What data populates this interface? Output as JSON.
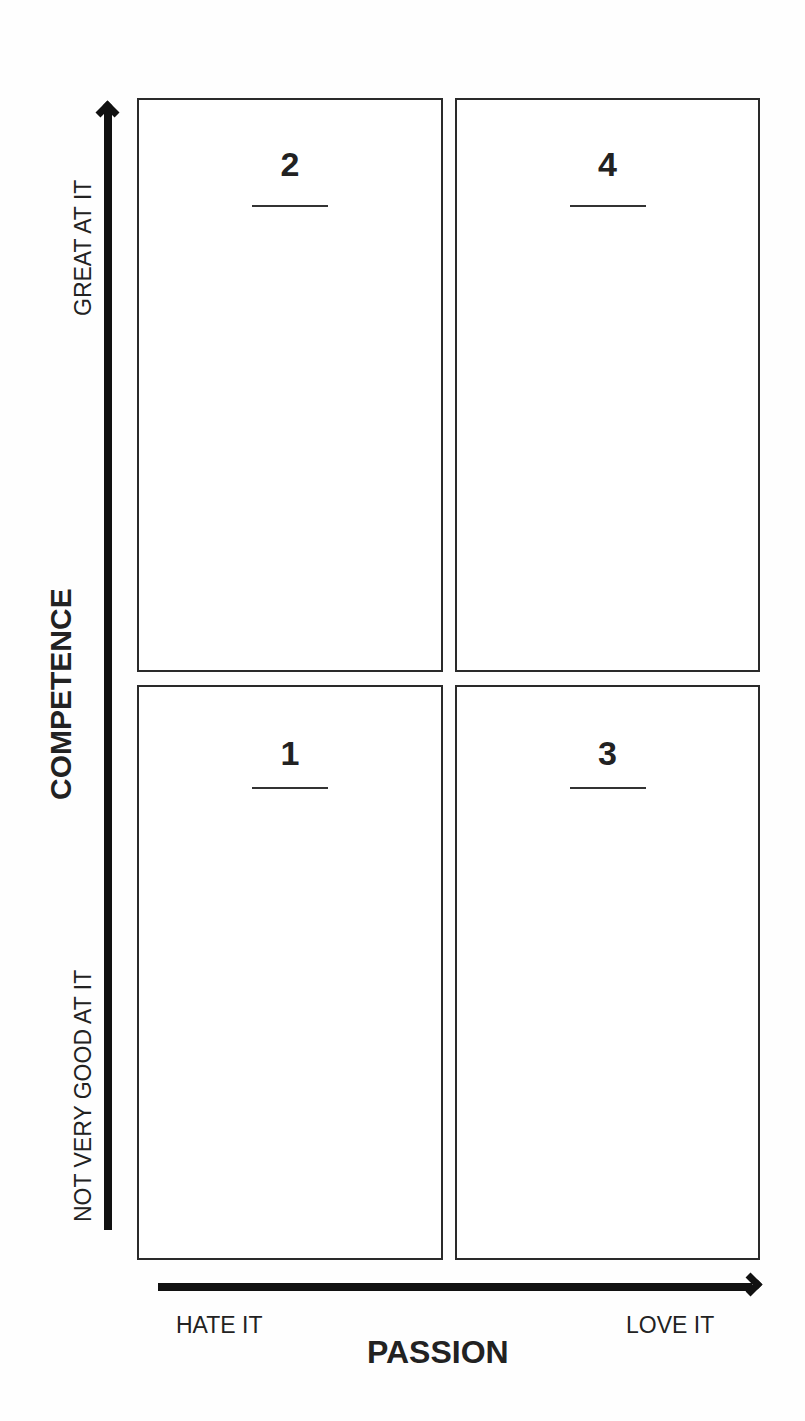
{
  "diagram": {
    "type": "2x2 matrix",
    "y_axis": {
      "title": "COMPETENCE",
      "high_label": "GREAT AT IT",
      "low_label": "NOT VERY GOOD AT IT"
    },
    "x_axis": {
      "title": "PASSION",
      "low_label": "HATE IT",
      "high_label": "LOVE IT"
    },
    "quadrants": [
      {
        "position": "top-left",
        "number": "2"
      },
      {
        "position": "top-right",
        "number": "4"
      },
      {
        "position": "bottom-left",
        "number": "1"
      },
      {
        "position": "bottom-right",
        "number": "3"
      }
    ]
  },
  "colors": {
    "line": "#2a2a2a",
    "arrow": "#111111",
    "background": "#fefefe"
  }
}
